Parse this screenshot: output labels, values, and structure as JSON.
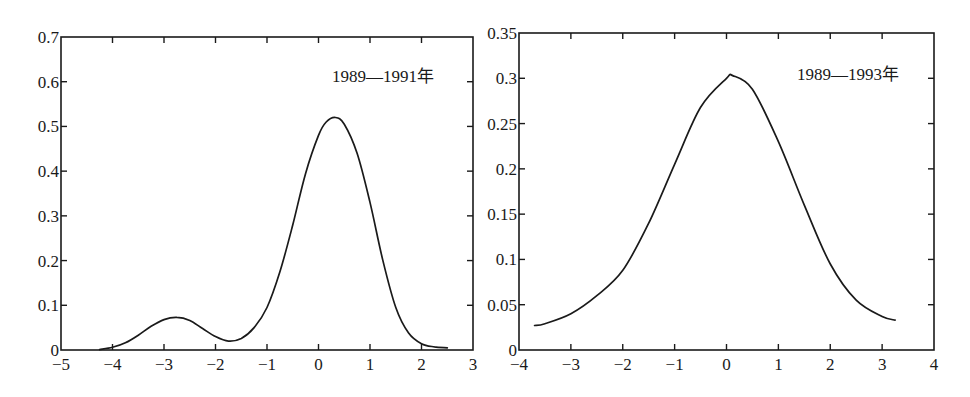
{
  "chart_data": [
    {
      "type": "line",
      "title": "",
      "annotation": "1989—1991年",
      "xlabel": "",
      "ylabel": "",
      "xlim": [
        -5,
        3
      ],
      "ylim": [
        0,
        0.7
      ],
      "xticks": [
        "-5",
        "-4",
        "-3",
        "-2",
        "-1",
        "0",
        "1",
        "2",
        "3"
      ],
      "yticks": [
        "0",
        "0.1",
        "0.2",
        "0.3",
        "0.4",
        "0.5",
        "0.6",
        "0.7"
      ],
      "grid": false,
      "legend": null,
      "series": [
        {
          "name": "1989—1991年",
          "x": [
            -4.25,
            -4.0,
            -3.75,
            -3.5,
            -3.25,
            -3.0,
            -2.75,
            -2.5,
            -2.25,
            -2.0,
            -1.75,
            -1.5,
            -1.25,
            -1.0,
            -0.75,
            -0.5,
            -0.25,
            0.0,
            0.15,
            0.33,
            0.5,
            0.75,
            1.0,
            1.25,
            1.5,
            1.75,
            2.0,
            2.25,
            2.5
          ],
          "y": [
            0.001,
            0.006,
            0.016,
            0.033,
            0.053,
            0.068,
            0.073,
            0.066,
            0.048,
            0.03,
            0.02,
            0.026,
            0.05,
            0.095,
            0.175,
            0.28,
            0.395,
            0.48,
            0.51,
            0.52,
            0.505,
            0.44,
            0.33,
            0.2,
            0.095,
            0.038,
            0.014,
            0.007,
            0.005
          ]
        }
      ]
    },
    {
      "type": "line",
      "title": "",
      "annotation": "1989—1993年",
      "xlabel": "",
      "ylabel": "",
      "xlim": [
        -4,
        4
      ],
      "ylim": [
        0,
        0.35
      ],
      "xticks": [
        "-4",
        "-3",
        "-2",
        "-1",
        "0",
        "1",
        "2",
        "3",
        "4"
      ],
      "yticks": [
        "0",
        "0.05",
        "0.1",
        "0.15",
        "0.2",
        "0.25",
        "0.3",
        "0.35"
      ],
      "grid": false,
      "legend": null,
      "series": [
        {
          "name": "1989—1993年",
          "x": [
            -3.7,
            -3.5,
            -3.0,
            -2.5,
            -2.0,
            -1.5,
            -1.0,
            -0.5,
            0.0,
            0.12,
            0.5,
            1.0,
            1.5,
            2.0,
            2.5,
            3.0,
            3.25
          ],
          "y": [
            0.027,
            0.029,
            0.04,
            0.06,
            0.088,
            0.14,
            0.205,
            0.268,
            0.3,
            0.303,
            0.288,
            0.23,
            0.16,
            0.095,
            0.055,
            0.037,
            0.033
          ]
        }
      ]
    }
  ]
}
